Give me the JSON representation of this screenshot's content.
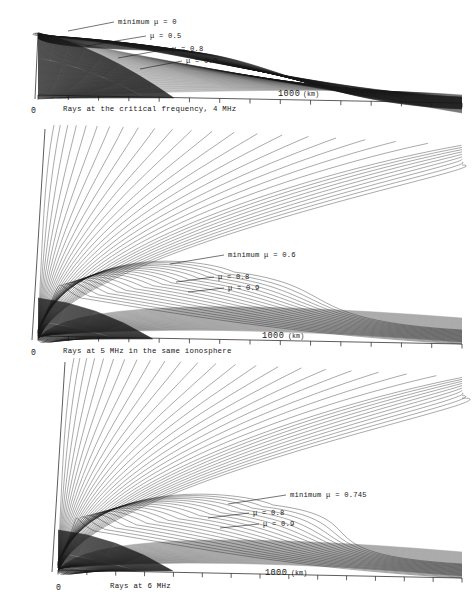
{
  "figure": {
    "background": "#ffffff",
    "ink": "#171717",
    "width": 472,
    "height": 612
  },
  "panels": [
    {
      "id": "panel-4mhz",
      "caption": "Rays at the critical frequency, 4 MHz",
      "frequency_mhz": 4,
      "caption_x": 63,
      "caption_y": 111,
      "origin_label": "0",
      "origin_x": 31,
      "origin_y": 113,
      "axis": {
        "unit_label": "(km)",
        "major_label": "1000",
        "major_value": 1000,
        "major_x": 278,
        "unit_x": 303,
        "label_y": 96,
        "tick_count": 14,
        "tick_spacing_km": 200,
        "x_start": 38,
        "x_end": 462,
        "y_start": 95,
        "y_end": 103
      },
      "geometry": {
        "launch_x": 38,
        "launch_y": 33,
        "ground_left_y": 99,
        "ground_right_y": 103,
        "top_y": 33,
        "ray_count": 46,
        "fan_style": "dense-dark",
        "ray_shade": "#202020",
        "ray_width": 0.45,
        "spread_top": 0.02,
        "spread_bottom": 0.62,
        "arc_depth": 0.3,
        "cusp_x": 150,
        "cusp_y": 52
      },
      "labels": [
        {
          "text": "minimum μ = 0",
          "text_x": 118,
          "text_y": 24,
          "leader_x1": 68,
          "leader_y1": 31,
          "leader_x2": 114,
          "leader_y2": 22
        },
        {
          "text": "μ = 0.5",
          "text_x": 150,
          "text_y": 38,
          "leader_x1": 86,
          "leader_y1": 46,
          "leader_x2": 146,
          "leader_y2": 36
        },
        {
          "text": "μ = 0.8",
          "text_x": 172,
          "text_y": 51,
          "leader_x1": 118,
          "leader_y1": 58,
          "leader_x2": 168,
          "leader_y2": 49
        },
        {
          "text": "μ = 0.9",
          "text_x": 186,
          "text_y": 63,
          "leader_x1": 140,
          "leader_y1": 69,
          "leader_x2": 182,
          "leader_y2": 61
        }
      ],
      "mu_values": [
        0,
        0.5,
        0.8,
        0.9
      ],
      "minimum_mu": 0
    },
    {
      "id": "panel-5mhz",
      "caption": "Rays at 5 MHz in the same ionosphere",
      "frequency_mhz": 5,
      "caption_x": 63,
      "caption_y": 353,
      "origin_label": "0",
      "origin_x": 31,
      "origin_y": 355,
      "axis": {
        "unit_label": "(km)",
        "major_label": "1000",
        "major_value": 1000,
        "major_x": 262,
        "unit_x": 288,
        "label_y": 338,
        "tick_count": 14,
        "tick_spacing_km": 200,
        "x_start": 38,
        "x_end": 462,
        "y_start": 336,
        "y_end": 344
      },
      "geometry": {
        "launch_x": 38,
        "launch_y": 340,
        "ground_left_y": 340,
        "ground_right_y": 344,
        "top_y": 129,
        "ray_count": 48,
        "fan_style": "upward-fan",
        "ray_shade": "#202020",
        "ray_width": 0.42,
        "escape_count": 30,
        "reflect_count": 18,
        "apex_x": 180,
        "apex_y": 272
      },
      "labels": [
        {
          "text": "minimum μ = 0.6",
          "text_x": 228,
          "text_y": 257,
          "leader_x1": 170,
          "leader_y1": 264,
          "leader_x2": 224,
          "leader_y2": 255
        },
        {
          "text": "μ = 0.8",
          "text_x": 218,
          "text_y": 279,
          "leader_x1": 176,
          "leader_y1": 282,
          "leader_x2": 214,
          "leader_y2": 277
        },
        {
          "text": "μ = 0.9",
          "text_x": 228,
          "text_y": 290,
          "leader_x1": 188,
          "leader_y1": 292,
          "leader_x2": 224,
          "leader_y2": 288
        }
      ],
      "mu_values": [
        0.6,
        0.8,
        0.9
      ],
      "minimum_mu": 0.6
    },
    {
      "id": "panel-6mhz",
      "caption": "Rays at 6 MHz",
      "frequency_mhz": 6,
      "caption_x": 110,
      "caption_y": 588,
      "origin_label": "0",
      "origin_x": 56,
      "origin_y": 590,
      "axis": {
        "unit_label": "(km)",
        "major_label": "1000",
        "major_value": 1000,
        "major_x": 265,
        "unit_x": 291,
        "label_y": 575,
        "tick_count": 14,
        "tick_spacing_km": 200,
        "x_start": 58,
        "x_end": 462,
        "y_start": 570,
        "y_end": 578
      },
      "geometry": {
        "launch_x": 58,
        "launch_y": 572,
        "ground_left_y": 572,
        "ground_right_y": 578,
        "top_y": 362,
        "ray_count": 50,
        "fan_style": "upward-fan",
        "ray_shade": "#202020",
        "ray_width": 0.42,
        "escape_count": 32,
        "reflect_count": 18,
        "apex_x": 210,
        "apex_y": 505
      },
      "labels": [
        {
          "text": "minimum μ = 0.745",
          "text_x": 290,
          "text_y": 497,
          "leader_x1": 228,
          "leader_y1": 504,
          "leader_x2": 286,
          "leader_y2": 495
        },
        {
          "text": "μ = 0.8",
          "text_x": 253,
          "text_y": 515,
          "leader_x1": 208,
          "leader_y1": 518,
          "leader_x2": 249,
          "leader_y2": 513
        },
        {
          "text": "μ = 0.9",
          "text_x": 263,
          "text_y": 526,
          "leader_x1": 220,
          "leader_y1": 528,
          "leader_x2": 259,
          "leader_y2": 524
        }
      ],
      "mu_values": [
        0.745,
        0.8,
        0.9
      ],
      "minimum_mu": 0.745
    }
  ],
  "chart_data": {
    "type": "line",
    "xlabel": "(km)",
    "ylabel": "",
    "xlim": [
      0,
      2800
    ],
    "grid": false,
    "legend": "inline-leader-labels",
    "series": [
      {
        "name": "Rays at the critical frequency, 4 MHz",
        "frequency_mhz": 4,
        "minimum_mu": 0,
        "mu_labels": [
          0,
          0.5,
          0.8,
          0.9
        ]
      },
      {
        "name": "Rays at 5 MHz in the same ionosphere",
        "frequency_mhz": 5,
        "minimum_mu": 0.6,
        "mu_labels": [
          0.6,
          0.8,
          0.9
        ]
      },
      {
        "name": "Rays at 6 MHz",
        "frequency_mhz": 6,
        "minimum_mu": 0.745,
        "mu_labels": [
          0.745,
          0.8,
          0.9
        ]
      }
    ],
    "x_tick_labels": [
      "0",
      "1000"
    ],
    "x_tick_spacing_km": 200
  }
}
